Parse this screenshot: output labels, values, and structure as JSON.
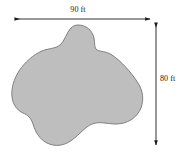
{
  "figure": {
    "kind": "irregular-region-area-diagram",
    "background_color": "#ffffff",
    "width_px": 179,
    "height_px": 155,
    "shape": {
      "name": "irregular-blob-region",
      "fill_color": "#bebebe",
      "stroke_color": "#808080",
      "stroke_width_px": 1
    },
    "dimensions": {
      "width": {
        "label": "90 ft",
        "value": 90,
        "unit": "ft",
        "orientation": "horizontal",
        "arrow_style": "double-headed",
        "position": "top"
      },
      "height": {
        "label": "80 ft",
        "value": 80,
        "unit": "ft",
        "orientation": "vertical",
        "arrow_style": "double-headed",
        "position": "right"
      }
    },
    "annotation_color": "#1a1a1a"
  }
}
